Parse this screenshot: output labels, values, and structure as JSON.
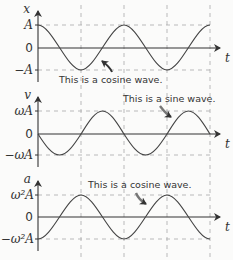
{
  "diagram": {
    "colors": {
      "curve": "#444444",
      "axis": "#333333",
      "guide": "#aaaaaa",
      "background": "#fbfbfa"
    },
    "panels": [
      {
        "id": "displacement",
        "y_axis_label": "x",
        "x_axis_label": "t",
        "top_label": "A",
        "zero_label": "0",
        "bottom_label": "−A",
        "wave": "cosine",
        "annotation": "This is a cosine wave."
      },
      {
        "id": "velocity",
        "y_axis_label": "v",
        "x_axis_label": "t",
        "top_label": "ωA",
        "zero_label": "0",
        "bottom_label": "−ωA",
        "wave": "negative sine",
        "annotation": "This is a sine wave."
      },
      {
        "id": "acceleration",
        "y_axis_label": "a",
        "x_axis_label": "t",
        "top_label": "ω²A",
        "zero_label": "0",
        "bottom_label": "−ω²A",
        "wave": "negative cosine",
        "annotation": "This is a cosine wave."
      }
    ]
  }
}
